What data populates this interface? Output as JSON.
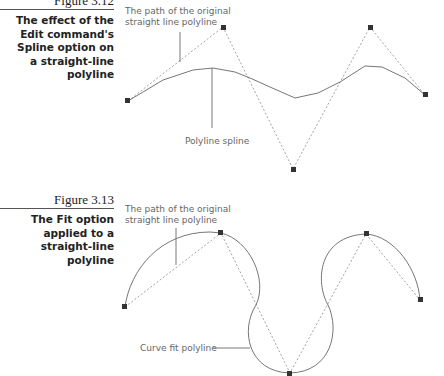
{
  "figures": [
    {
      "number": "Figure 3.12",
      "caption_lines": [
        "The effect of the",
        "Edit command's",
        "Spline option on",
        "a straight-line",
        "polyline"
      ],
      "label_path": [
        "The path of the original",
        "straight line polyline"
      ],
      "label_curve": "Polyline spline",
      "vertices": [
        [
          128,
          101
        ],
        [
          223,
          27
        ],
        [
          293,
          169
        ],
        [
          370,
          27
        ],
        [
          425,
          95
        ]
      ]
    },
    {
      "number": "Figure 3.13",
      "caption_lines": [
        "The Fit option",
        "applied to a",
        "straight-line",
        "polyline"
      ],
      "label_path": [
        "The path of the original",
        "straight line polyline"
      ],
      "label_curve": "Curve fit polyline",
      "vertices": [
        [
          125,
          307
        ],
        [
          221,
          233
        ],
        [
          290,
          373
        ],
        [
          366,
          234
        ],
        [
          420,
          300
        ]
      ]
    }
  ],
  "colors": {
    "line": "#777777",
    "vertex": "#333333",
    "text": "#222222",
    "label": "#666666"
  }
}
